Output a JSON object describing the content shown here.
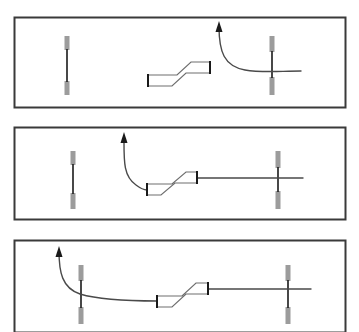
{
  "figure": {
    "title": "",
    "width": 359,
    "height": 332,
    "background": "#ffffff",
    "panel_count": 3
  },
  "colors": {
    "frame_stroke": "#3a3a3a",
    "guide_stroke": "#4a4a4a",
    "device_stroke": "#6e6e6e",
    "device_fill": "#ffffff",
    "post_cap": "#9c9c9c",
    "post_shaft": "#1a1a1a",
    "arrow_fill": "#1a1a1a",
    "background": "#ffffff"
  },
  "geometry": {
    "frame_stroke_width": 2,
    "guide_stroke_width": 1.4,
    "device_stroke_width": 1.2,
    "post_cap_width": 5,
    "post_shaft_width": 1.6
  },
  "panels": [
    {
      "index": 1,
      "label": "stage-1",
      "frame": {
        "x": 14,
        "y": 17,
        "width": 331,
        "height": 90
      },
      "posts": [
        {
          "name": "left-marker-post",
          "cx": 67,
          "top": 36,
          "bottom": 95,
          "cap_top_len": 14,
          "cap_bottom_len": 14
        },
        {
          "name": "right-marker-post",
          "cx": 272,
          "top": 36,
          "bottom": 95,
          "cap_top_len": 16,
          "cap_bottom_len": 18
        }
      ],
      "device": {
        "name": "offset-connector",
        "path": "M 148 75 L 177 75 L 191 62 L 210 62 L 210 73 L 186 73 L 172 86 L 148 86 Z",
        "end_caps": [
          {
            "x": 148,
            "y1": 74,
            "y2": 87
          },
          {
            "x": 210,
            "y1": 61,
            "y2": 74
          }
        ]
      },
      "guide": {
        "name": "guidewire-path",
        "path": "M 219 26 C 219 52, 224 66, 245 70 C 262 73, 280 71, 301 71",
        "arrow": {
          "tip_x": 219,
          "tip_y": 21,
          "width": 7,
          "height": 11,
          "direction": "up"
        }
      }
    },
    {
      "index": 2,
      "label": "stage-2",
      "frame": {
        "x": 14,
        "y": 127,
        "width": 331,
        "height": 92
      },
      "posts": [
        {
          "name": "left-marker-post",
          "cx": 73,
          "top": 151,
          "bottom": 209,
          "cap_top_len": 14,
          "cap_bottom_len": 16
        },
        {
          "name": "right-marker-post",
          "cx": 278,
          "top": 151,
          "bottom": 209,
          "cap_top_len": 17,
          "cap_bottom_len": 18
        }
      ],
      "device": {
        "name": "offset-connector",
        "path": "M 147 184 L 172 184 L 186 172 L 197 172 L 197 183 L 175 183 L 161 195 L 147 195 Z",
        "end_caps": [
          {
            "x": 147,
            "y1": 183,
            "y2": 196
          },
          {
            "x": 197,
            "y1": 171,
            "y2": 184
          }
        ]
      },
      "guide": {
        "name": "guidewire-path",
        "path": "M 124 137 C 124 160, 123 176, 136 185 C 140 188, 143 190, 147 190 M 197 178 L 303 178",
        "arrow": {
          "tip_x": 124,
          "tip_y": 132,
          "width": 7,
          "height": 11,
          "direction": "up"
        }
      }
    },
    {
      "index": 3,
      "label": "stage-3",
      "frame": {
        "x": 14,
        "y": 240,
        "width": 331,
        "height": 92
      },
      "posts": [
        {
          "name": "left-marker-post",
          "cx": 81,
          "top": 265,
          "bottom": 324,
          "cap_top_len": 16,
          "cap_bottom_len": 17
        },
        {
          "name": "right-marker-post",
          "cx": 288,
          "top": 265,
          "bottom": 324,
          "cap_top_len": 16,
          "cap_bottom_len": 17
        }
      ],
      "device": {
        "name": "offset-connector",
        "path": "M 157 296 L 182 296 L 196 283 L 208 283 L 208 294 L 186 294 L 172 307 L 157 307 Z",
        "end_caps": [
          {
            "x": 157,
            "y1": 295,
            "y2": 308
          },
          {
            "x": 208,
            "y1": 282,
            "y2": 295
          }
        ]
      },
      "guide": {
        "name": "guidewire-path",
        "path": "M 59 251 C 59 272, 62 288, 80 294 C 100 300, 130 301, 157 301 M 208 289 L 311 289",
        "arrow": {
          "tip_x": 59,
          "tip_y": 246,
          "width": 7,
          "height": 11,
          "direction": "up"
        }
      }
    }
  ]
}
